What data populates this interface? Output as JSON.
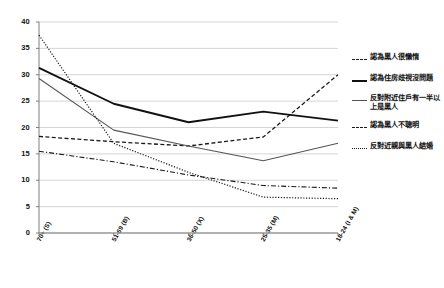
{
  "chart_data": {
    "type": "line",
    "title": "",
    "subtitle": "",
    "xlabel": "",
    "ylabel": "",
    "ylim": [
      0,
      40
    ],
    "yticks": [
      "0",
      "5",
      "10",
      "15",
      "20",
      "25",
      "30",
      "35",
      "40"
    ],
    "grid": true,
    "legend_position": "right",
    "categories": [
      "70+ (S)",
      "51-69 (B)",
      "36-50 (X)",
      "25-35 (M)",
      "18-24 (I & M)"
    ],
    "series": [
      {
        "name": "認為黑人很懶惰",
        "style": "dashed",
        "color": "#1a1a1a",
        "values": [
          18.3,
          17.3,
          16.5,
          18.2,
          30.0
        ]
      },
      {
        "name": "認為住房歧視沒問題",
        "style": "solid-thick",
        "color": "#111111",
        "values": [
          31.3,
          24.5,
          21.0,
          23.0,
          21.3
        ]
      },
      {
        "name": "反對附近住戶有一半以上是黑人",
        "style": "solid-thin",
        "color": "#555555",
        "values": [
          29.3,
          19.5,
          16.5,
          13.7,
          17.0
        ]
      },
      {
        "name": "認為黑人不聰明",
        "style": "dashdot",
        "color": "#1a1a1a",
        "values": [
          15.5,
          13.5,
          11.0,
          9.0,
          8.5
        ]
      },
      {
        "name": "反對近親與黑人結婚",
        "style": "dotted",
        "color": "#1a1a1a",
        "values": [
          37.5,
          17.0,
          11.5,
          6.8,
          6.5
        ]
      }
    ]
  },
  "legend": {
    "entries": [
      {
        "label": "認為黑人很懶惰",
        "key": "dashed"
      },
      {
        "label": "認為住房歧視沒問題",
        "key": "solid-thick"
      },
      {
        "label": "反對附近住戶有一半以上是黑人",
        "key": "solid-thin"
      },
      {
        "label": "認為黑人不聰明",
        "key": "dashdot"
      },
      {
        "label": "反對近親與黑人結婚",
        "key": "dotted"
      }
    ]
  },
  "colors": {
    "grid": "#c9c9c9",
    "axis": "#7f7f7f",
    "plot_background": "#ffffff",
    "series_dark": "#111111",
    "series_gray": "#555555"
  }
}
